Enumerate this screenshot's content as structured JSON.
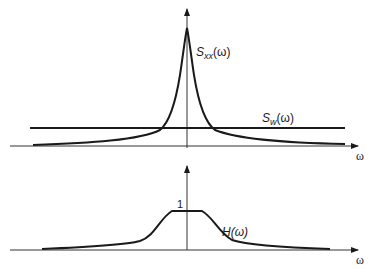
{
  "upper_plot": {
    "curve_label_main": "S",
    "curve_label_sub": "xx",
    "curve_label_arg": "(ω)",
    "noise_label_main": "S",
    "noise_label_sub": "w",
    "noise_label_arg": "(ω)",
    "x_axis_label": "ω"
  },
  "lower_plot": {
    "curve_label": "H(ω)",
    "plateau_label": "1",
    "x_axis_label": "ω"
  },
  "colors": {
    "stroke": "#1a1a1a",
    "axis": "#333333",
    "background": "#ffffff"
  }
}
